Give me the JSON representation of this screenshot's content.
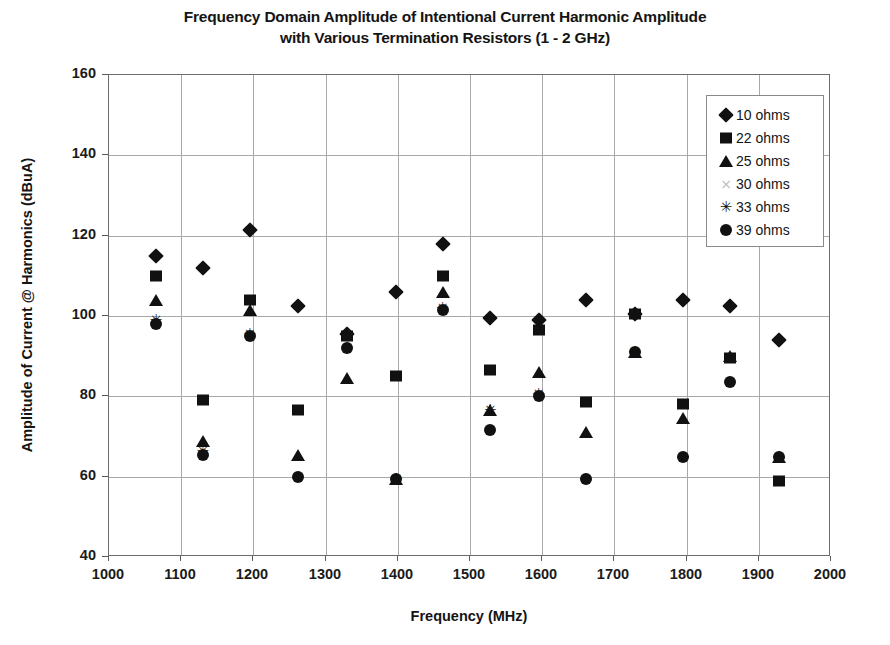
{
  "chart_data": {
    "type": "scatter",
    "title": "Frequency Domain Amplitude of Intentional Current Harmonic Amplitude with Various Termination Resistors (1 - 2 GHz)",
    "title_line1": "Frequency Domain Amplitude of Intentional Current Harmonic Amplitude",
    "title_line2": "with Various Termination Resistors (1 - 2 GHz)",
    "xlabel": "Frequency (MHz)",
    "ylabel": "Amplitude of Current @ Harmonics (dBuA)",
    "xlim": [
      1000,
      2000
    ],
    "ylim": [
      40,
      160
    ],
    "xticks": [
      1000,
      1100,
      1200,
      1300,
      1400,
      1500,
      1600,
      1700,
      1800,
      1900,
      2000
    ],
    "yticks": [
      40,
      60,
      80,
      100,
      120,
      140,
      160
    ],
    "grid": true,
    "legend_position": "top-right",
    "marker_color": "#111111",
    "x": [
      1065,
      1130,
      1195,
      1262,
      1330,
      1398,
      1462,
      1528,
      1595,
      1660,
      1728,
      1795,
      1860,
      1928
    ],
    "series": [
      {
        "name": "10 ohms",
        "marker": "diamond",
        "values": [
          115,
          112,
          121.5,
          102.5,
          95.5,
          106,
          118,
          99.5,
          99,
          104,
          100.5,
          104,
          102.5,
          94
        ]
      },
      {
        "name": "22 ohms",
        "marker": "square",
        "values": [
          110,
          79,
          104,
          76.5,
          95,
          85,
          110,
          86.5,
          96.5,
          78.5,
          100.5,
          78,
          89.5,
          59
        ]
      },
      {
        "name": "25 ohms",
        "marker": "triangle",
        "values": [
          104,
          69,
          101.5,
          65.5,
          84.5,
          59.5,
          106,
          76.5,
          86,
          71,
          91,
          74.5,
          90,
          65
        ]
      },
      {
        "name": "30 ohms",
        "marker": "x",
        "values": [
          98.5,
          66,
          95.5,
          60,
          92,
          59.5,
          101.5,
          76.5,
          80,
          59.5,
          91,
          65,
          83.5,
          65
        ]
      },
      {
        "name": "33 ohms",
        "marker": "star",
        "values": [
          99,
          66.5,
          95.5,
          60,
          92,
          59.5,
          102,
          76.5,
          80.5,
          59.5,
          91,
          65,
          83.5,
          65
        ]
      },
      {
        "name": "39 ohms",
        "marker": "circle",
        "values": [
          98,
          65.5,
          95,
          60,
          92,
          59.5,
          101.5,
          71.5,
          80,
          59.5,
          91,
          65,
          83.5,
          65
        ]
      }
    ]
  }
}
